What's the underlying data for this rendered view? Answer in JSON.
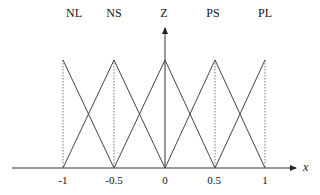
{
  "diagram": {
    "type": "fuzzy-membership-functions",
    "sets": [
      {
        "label": "NL",
        "center": -1
      },
      {
        "label": "NS",
        "center": -0.5
      },
      {
        "label": "Z",
        "center": 0
      },
      {
        "label": "PS",
        "center": 0.5
      },
      {
        "label": "PL",
        "center": 1
      }
    ],
    "x_ticks": [
      "-1",
      "-0.5",
      "0",
      "0.5",
      "1"
    ],
    "x_axis_label": "x",
    "colors": {
      "line": "#444444",
      "axis": "#333333",
      "text": "#111111"
    }
  }
}
